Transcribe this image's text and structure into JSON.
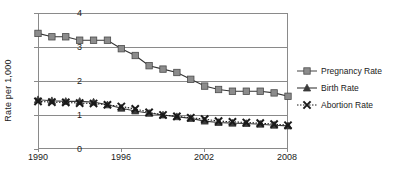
{
  "chart_data": {
    "type": "line",
    "title": "",
    "xlabel": "",
    "ylabel": "Rate per 1,000",
    "xlim": [
      1990,
      2008
    ],
    "ylim": [
      0,
      4
    ],
    "yticks": [
      0,
      1,
      2,
      3,
      4
    ],
    "xticks": [
      1990,
      1996,
      2002,
      2008
    ],
    "grid": "horizontal",
    "legend_position": "right",
    "x": [
      1990,
      1991,
      1992,
      1993,
      1994,
      1995,
      1996,
      1997,
      1998,
      1999,
      2000,
      2001,
      2002,
      2003,
      2004,
      2005,
      2006,
      2007,
      2008
    ],
    "series": [
      {
        "name": "Pregnancy Rate",
        "marker": "square",
        "line": "solid",
        "color": "#8c8c8c",
        "values": [
          3.4,
          3.3,
          3.3,
          3.2,
          3.2,
          3.2,
          2.95,
          2.75,
          2.45,
          2.35,
          2.25,
          2.05,
          1.85,
          1.75,
          1.7,
          1.7,
          1.7,
          1.65,
          1.55
        ]
      },
      {
        "name": "Birth Rate",
        "marker": "triangle",
        "line": "solid",
        "color": "#3a3a3a",
        "values": [
          1.45,
          1.42,
          1.4,
          1.4,
          1.38,
          1.3,
          1.2,
          1.12,
          1.05,
          1.0,
          0.95,
          0.9,
          0.82,
          0.78,
          0.76,
          0.75,
          0.73,
          0.7,
          0.68
        ]
      },
      {
        "name": "Abortion Rate",
        "marker": "x",
        "line": "dotted",
        "color": "#1a1a1a",
        "values": [
          1.4,
          1.38,
          1.37,
          1.35,
          1.34,
          1.3,
          1.25,
          1.18,
          1.08,
          1.0,
          0.96,
          0.92,
          0.88,
          0.82,
          0.8,
          0.78,
          0.76,
          0.73,
          0.7
        ]
      }
    ]
  },
  "legend": {
    "items": [
      {
        "label": "Pregnancy Rate"
      },
      {
        "label": "Birth Rate"
      },
      {
        "label": "Abortion Rate"
      }
    ]
  },
  "axes": {
    "y_title": "Rate per 1,000",
    "y_tick_labels": [
      "4",
      "3",
      "2",
      "1",
      "0"
    ],
    "x_tick_labels": [
      "1990",
      "1996",
      "2002",
      "2008"
    ]
  }
}
